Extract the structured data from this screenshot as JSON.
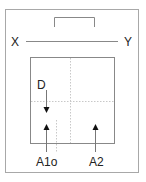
{
  "diagram": {
    "labels": {
      "left_end": "X",
      "right_end": "Y",
      "top_arrow_label": "D",
      "bottom_left": "A1o",
      "bottom_right": "A2"
    },
    "colors": {
      "frame": "#a8a8a8",
      "line": "#777777",
      "dotted": "#c8c8c8",
      "arrow": "#111111",
      "text": "#222222"
    }
  }
}
